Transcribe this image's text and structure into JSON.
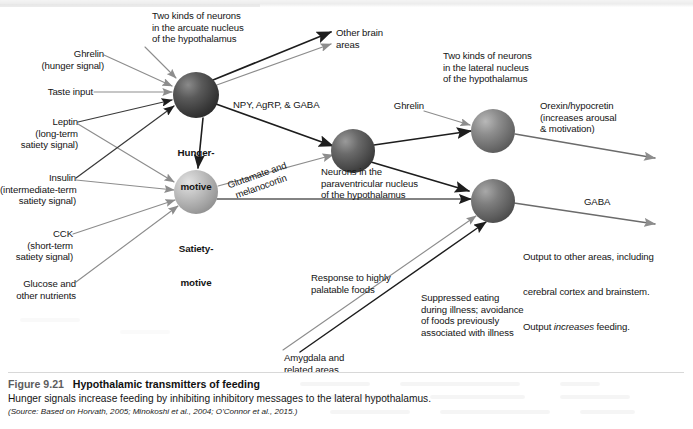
{
  "figure": {
    "number": "Figure 9.21",
    "title": "Hypothalamic transmitters of feeding",
    "body": "Hunger signals increase feeding by inhibiting inhibitory messages to the lateral hypothalamus.",
    "source": "(Source: Based on Horvath, 2005; Minokoshi et al., 2004; O'Connor et al., 2015.)"
  },
  "nodes": {
    "hunger": {
      "label_line1": "Hunger-",
      "label_line2": "motive",
      "fill": "#4a4a4a"
    },
    "satiety": {
      "label_line1": "Satiety-",
      "label_line2": "motive",
      "fill": "#b4b4b4"
    },
    "paraventricular": {
      "fill": "#5a5a5a"
    },
    "lateral_upper": {
      "fill": "#7d7d7d"
    },
    "lateral_lower": {
      "fill": "#6e6e6e"
    }
  },
  "annotations": {
    "arcuate_group": "Two kinds of neurons\nin the arcuate nucleus\nof the hypothalamus",
    "lateral_group": "Two kinds of neurons\nin the lateral nucleus\nof the hypothalamus",
    "pvn_group": "Neurons in the\nparaventricular nucleus\nof the hypothalamus",
    "other_brain_areas": "Other brain\nareas",
    "output_note": "Output to other areas, including\ncerebral cortex and brainstem.\nOutput increases feeding."
  },
  "inputs": [
    {
      "name": "ghrelin_left",
      "text": "Ghrelin\n(hunger signal)"
    },
    {
      "name": "taste_input",
      "text": "Taste input"
    },
    {
      "name": "leptin",
      "text": "Leptin\n(long-term\nsatiety signal)"
    },
    {
      "name": "insulin",
      "text": "Insulin\n(intermediate-term\nsatiety signal)"
    },
    {
      "name": "cck",
      "text": "CCK\n(short-term\nsatiety signal)"
    },
    {
      "name": "glucose",
      "text": "Glucose and\nother nutrients"
    },
    {
      "name": "ghrelin_right",
      "text": "Ghrelin"
    },
    {
      "name": "amygdala",
      "text": "Amygdala and\nrelated areas"
    }
  ],
  "transmitters": {
    "npy": "NPY, AgRP, & GABA",
    "glutamate": "Glutamate and\nmelanocortin",
    "orexin": "Orexin/hypocretin\n(increases arousal\n& motivation)",
    "gaba": "GABA"
  },
  "pathway_notes": {
    "palatable": "Response to highly\npalatable foods",
    "illness": "Suppressed eating\nduring illness; avoidance\nof foods previously\nassociated with illness"
  },
  "colors": {
    "ink": "#141414",
    "arrow_dark": "#1d1d1d",
    "arrow_light": "#8d8d8d",
    "page": "#ffffff"
  }
}
